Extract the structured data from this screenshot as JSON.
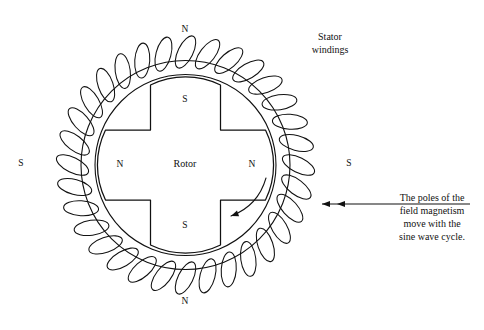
{
  "figure": {
    "title_visible": false,
    "background": "#ffffff",
    "ink": "#111111",
    "width": 484,
    "height": 330
  },
  "geometry": {
    "center": {
      "x": 185.5,
      "y": 165
    },
    "stator_outer_radius": 104.5,
    "rotor_bore_radius": 90.5,
    "coil_count": 32,
    "coil_loop_semi_major": 17.5,
    "coil_loop_semi_minor": 7.5,
    "coil_ring_radius": 113,
    "rotor_cross_half_width": 35,
    "rotor_cross_half_span": 80,
    "rotor_pole_cap_radius": 80
  },
  "labels": {
    "stator_poles": [
      {
        "name": "stator-pole-top",
        "text": "N",
        "x": 185,
        "y": 30
      },
      {
        "name": "stator-pole-right",
        "text": "S",
        "x": 349,
        "y": 164
      },
      {
        "name": "stator-pole-bottom",
        "text": "N",
        "x": 185,
        "y": 302
      },
      {
        "name": "stator-pole-left",
        "text": "S",
        "x": 21,
        "y": 164
      }
    ],
    "rotor_poles": [
      {
        "name": "rotor-pole-top",
        "text": "S",
        "x": 185,
        "y": 100
      },
      {
        "name": "rotor-pole-right",
        "text": "N",
        "x": 252,
        "y": 165
      },
      {
        "name": "rotor-pole-bottom",
        "text": "S",
        "x": 185,
        "y": 226
      },
      {
        "name": "rotor-pole-left",
        "text": "N",
        "x": 120,
        "y": 165
      }
    ],
    "rotor_center": {
      "text": "Rotor",
      "x": 185,
      "y": 165
    }
  },
  "callouts": {
    "stator_windings": {
      "lines": [
        "Stator",
        "windings"
      ],
      "x": 330,
      "y": 40,
      "line_height": 13
    },
    "field_note": {
      "lines": [
        "The poles of the",
        "field magnetism",
        "move with the",
        "sine wave cycle."
      ],
      "x": 432,
      "y": 201,
      "line_height": 13,
      "leader": {
        "from_x": 470,
        "to_x": 322,
        "y": 204,
        "arrowheads": 2
      }
    }
  },
  "rotation_arrow": {
    "name": "rotor-rotation-arrow",
    "description": "curved arrow showing rotor rotation direction",
    "direction": "counterclockwise"
  }
}
